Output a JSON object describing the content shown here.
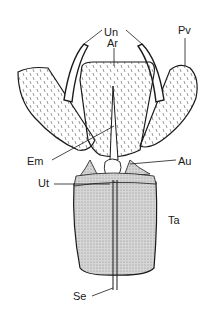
{
  "diagram": {
    "labels": {
      "un": "Un",
      "ar": "Ar",
      "pv": "Pv",
      "em": "Em",
      "au": "Au",
      "ut": "Ut",
      "ta": "Ta",
      "se": "Se"
    },
    "colors": {
      "ink": "#1a1a1a",
      "stipple": "#bdbdbd",
      "background": "#ffffff"
    }
  }
}
